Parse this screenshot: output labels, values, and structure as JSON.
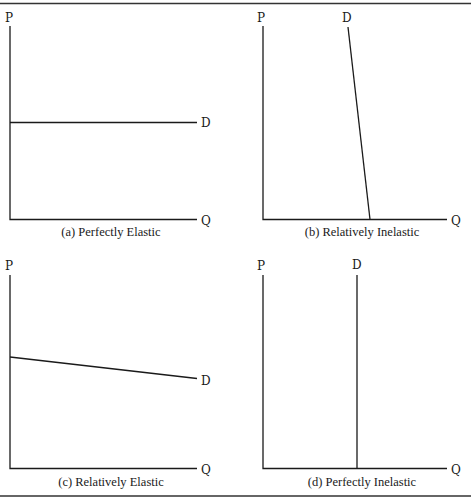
{
  "figure": {
    "panels": [
      {
        "id": "a",
        "caption": "(a) Perfectly Elastic",
        "y_label": "P",
        "x_label": "Q",
        "curve_label": "D",
        "curve_type": "horizontal"
      },
      {
        "id": "b",
        "caption": "(b) Relatively Inelastic",
        "y_label": "P",
        "x_label": "Q",
        "curve_label": "D",
        "curve_type": "steep-downward"
      },
      {
        "id": "c",
        "caption": "(c) Relatively Elastic",
        "y_label": "P",
        "x_label": "Q",
        "curve_label": "D",
        "curve_type": "flat-downward"
      },
      {
        "id": "d",
        "caption": "(d) Perfectly Inelastic",
        "y_label": "P",
        "x_label": "Q",
        "curve_label": "D",
        "curve_type": "vertical"
      }
    ]
  }
}
